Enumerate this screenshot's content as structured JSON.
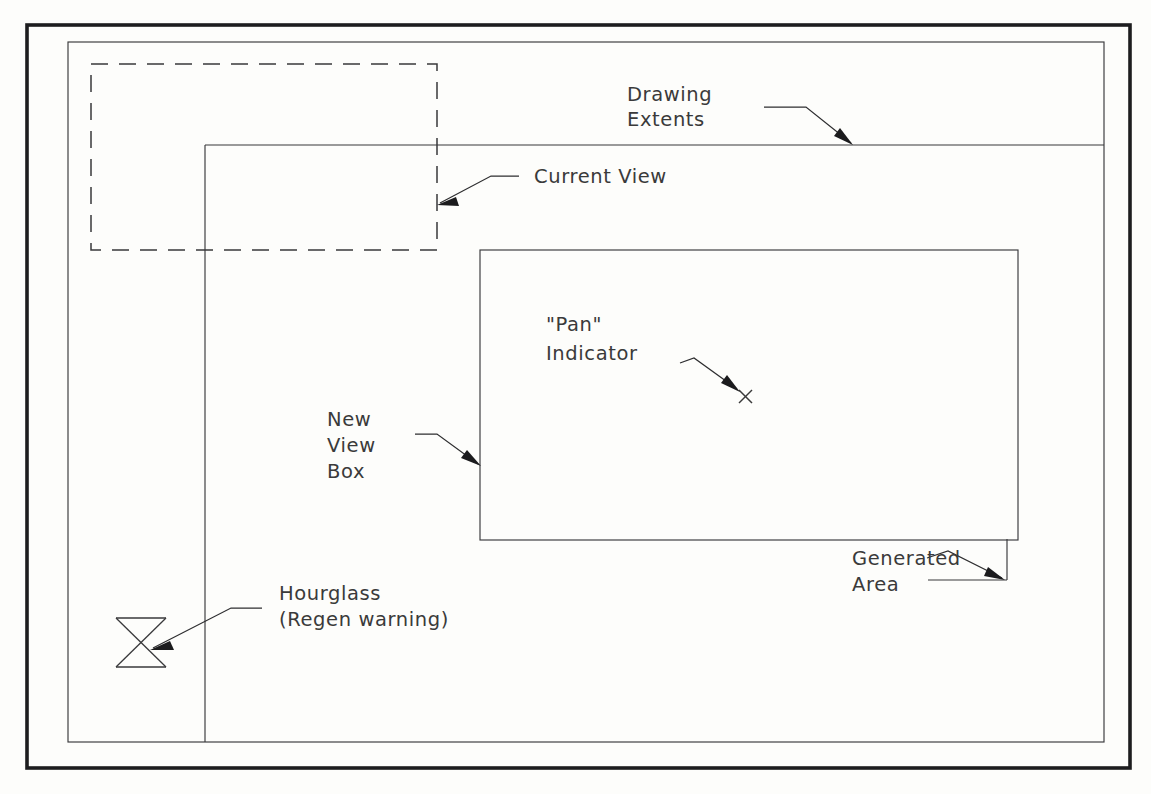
{
  "document": {
    "title": "Pan and Zoom Dynamic View Diagram",
    "background_color": "#fdfdfb",
    "line_color": "#39393b",
    "text_color": "#3a3a3a",
    "frame_color": "#1d1d1f"
  },
  "annotations": {
    "drawing_extents": {
      "line1": "Drawing",
      "line2": "Extents"
    },
    "current_view": {
      "line1": "Current View"
    },
    "pan_indicator": {
      "line1": "\"Pan\"",
      "line2": "Indicator"
    },
    "new_view_box": {
      "line1": "New",
      "line2": "View",
      "line3": "Box"
    },
    "generated_area": {
      "line1": "Generated",
      "line2": "Area"
    },
    "hourglass": {
      "line1": "Hourglass",
      "line2": "(Regen warning)"
    }
  },
  "shapes": {
    "outer_frame": {
      "x": 27,
      "y": 25,
      "width": 1103,
      "height": 743
    },
    "drawing_extents_rect": {
      "x": 68,
      "y": 42,
      "width": 1036,
      "height": 700
    },
    "current_view_dashed_rect": {
      "x": 91,
      "y": 64,
      "width": 346,
      "height": 186
    },
    "generated_area_region": {
      "x": 205,
      "y": 145,
      "right": 1104,
      "bottom": 742
    },
    "new_view_box_rect": {
      "x": 480,
      "y": 250,
      "width": 538,
      "height": 290
    },
    "pan_indicator_mark": {
      "cx": 745,
      "cy": 396,
      "size": 7
    },
    "hourglass_glyph": {
      "x": 116,
      "y": 618,
      "width": 50,
      "height": 49
    },
    "generated_area_corner": {
      "vx": 1007,
      "vy": 539,
      "vy2": 580,
      "hx": 928
    }
  }
}
